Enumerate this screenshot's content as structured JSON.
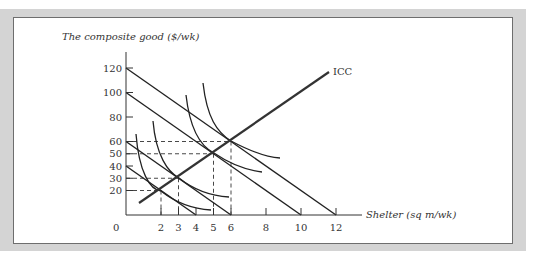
{
  "chart_data": {
    "type": "line",
    "title": "",
    "ylabel": "The composite good ($/wk)",
    "xlabel": "Shelter (sq m/wk)",
    "xlim": [
      0,
      13
    ],
    "ylim": [
      0,
      130
    ],
    "x_ticks": [
      0,
      2,
      3,
      4,
      5,
      6,
      8,
      10,
      12
    ],
    "y_ticks": [
      20,
      30,
      40,
      50,
      60,
      80,
      100,
      120
    ],
    "grid": false,
    "budget_lines": [
      {
        "name": "B1",
        "y_intercept": 40,
        "x_intercept": 4
      },
      {
        "name": "B2",
        "y_intercept": 60,
        "x_intercept": 6
      },
      {
        "name": "B3",
        "y_intercept": 100,
        "x_intercept": 10
      },
      {
        "name": "B4",
        "y_intercept": 120,
        "x_intercept": 12
      }
    ],
    "tangency_points": [
      {
        "x": 2,
        "y": 20
      },
      {
        "x": 3,
        "y": 30
      },
      {
        "x": 5,
        "y": 50
      },
      {
        "x": 6,
        "y": 60
      }
    ],
    "indifference_curves": [
      "I1",
      "I2",
      "I3",
      "I4"
    ],
    "annotations": [
      {
        "text": "ICC",
        "description": "Income-consumption curve through tangency points"
      }
    ]
  },
  "labels": {
    "origin": "0",
    "icc": "ICC",
    "y_axis_title": "The composite good ($/wk)",
    "x_axis_title": "Shelter (sq m/wk)"
  }
}
